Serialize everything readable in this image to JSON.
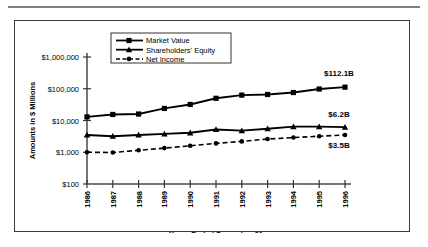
{
  "figure": {
    "border_color": "#3a3a3a",
    "rule_color": "#808080"
  },
  "chart_data": {
    "type": "line",
    "title": "",
    "xlabel": "Years Ended December 31",
    "ylabel": "Amounts in $ Millions",
    "yscale": "log",
    "ylim": [
      100,
      1000000
    ],
    "ytick_labels": [
      "$100",
      "$1,000",
      "$10,000",
      "$100,000",
      "$1,000,000"
    ],
    "ytick_values": [
      100,
      1000,
      10000,
      100000,
      1000000
    ],
    "grid": false,
    "legend_position": "upper-left-inside",
    "categories": [
      "1986",
      "1987",
      "1988",
      "1989",
      "1990",
      "1991",
      "1992",
      "1993",
      "1994",
      "1995",
      "1996"
    ],
    "series": [
      {
        "name": "Market Value",
        "marker": "square",
        "line": "solid",
        "color": "#000000",
        "values": [
          13000,
          15500,
          16000,
          24000,
          32000,
          50000,
          63000,
          66000,
          76000,
          98000,
          112100
        ]
      },
      {
        "name": "Shareholders' Equity",
        "marker": "triangle",
        "line": "solid",
        "color": "#000000",
        "values": [
          3500,
          3200,
          3500,
          3800,
          4100,
          5200,
          4800,
          5500,
          6400,
          6400,
          6200
        ]
      },
      {
        "name": "Net Income",
        "marker": "circle",
        "line": "dashed",
        "color": "#000000",
        "values": [
          1000,
          980,
          1150,
          1350,
          1600,
          1900,
          2200,
          2600,
          2900,
          3200,
          3500
        ]
      }
    ],
    "annotations": [
      {
        "text": "$112.1B",
        "series": "Market Value",
        "at_category": "1996"
      },
      {
        "text": "$6.2B",
        "series": "Shareholders' Equity",
        "at_category": "1996"
      },
      {
        "text": "$3.5B",
        "series": "Net Income",
        "at_category": "1996"
      }
    ]
  }
}
